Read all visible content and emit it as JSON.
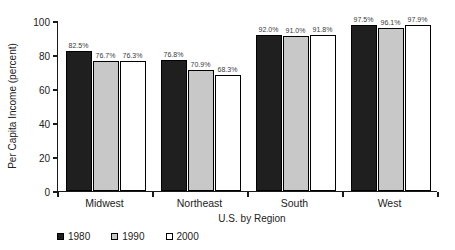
{
  "chart_data": {
    "type": "bar",
    "title": "",
    "categories": [
      "Midwest",
      "Northeast",
      "South",
      "West"
    ],
    "series": [
      {
        "name": "1980",
        "color": "#1f1f1f",
        "values": [
          82.5,
          76.8,
          92.0,
          97.5
        ]
      },
      {
        "name": "1990",
        "color": "#c8c8c8",
        "values": [
          76.7,
          70.9,
          91.0,
          96.1
        ]
      },
      {
        "name": "2000",
        "color": "#ffffff",
        "values": [
          76.3,
          68.3,
          91.8,
          97.9
        ]
      }
    ],
    "value_labels": [
      [
        "82.5%",
        "76.7%",
        "76.3%"
      ],
      [
        "76.8%",
        "70.9%",
        "68.3%"
      ],
      [
        "92.0%",
        "91.0%",
        "91.8%"
      ],
      [
        "97.5%",
        "96.1%",
        "97.9%"
      ]
    ],
    "xlabel": "U.S. by Region",
    "ylabel": "Per Capita Income (percent)",
    "ylim": [
      0,
      100
    ],
    "yticks": [
      0,
      20,
      40,
      60,
      80,
      100
    ],
    "grid": false,
    "legend_position": "bottom-left",
    "bar_border_color": "#000000",
    "axis_color": "#1a1a1a"
  }
}
